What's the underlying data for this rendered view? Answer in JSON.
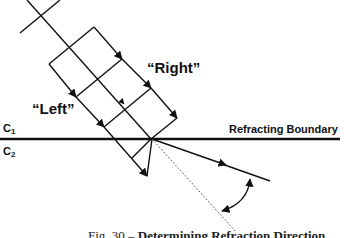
{
  "diagram": {
    "labels": {
      "right": "“Right”",
      "left": "“Left”",
      "medium1": "C",
      "medium1_sub": "1",
      "medium2": "C",
      "medium2_sub": "2",
      "boundary": "Refracting Boundary"
    },
    "caption": {
      "prefix": "Fig. 30 –",
      "title": "Determining Refraction Direction"
    },
    "colors": {
      "line": "#111111",
      "dotted": "#444444",
      "background": "#ffffff"
    }
  }
}
